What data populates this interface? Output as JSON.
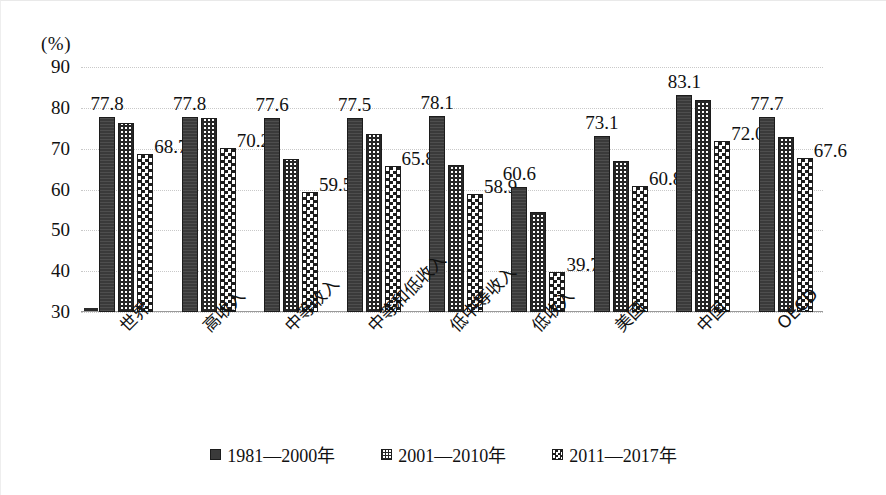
{
  "chart_data": {
    "type": "bar",
    "title": "",
    "xlabel": "",
    "ylabel": "",
    "unit_label": "(%)",
    "ylim": [
      30,
      90
    ],
    "yticks": [
      30,
      40,
      50,
      60,
      70,
      80,
      90
    ],
    "grid": true,
    "legend_position": "bottom",
    "categories": [
      "世界",
      "高收入",
      "中等收入",
      "中等和低收入",
      "低中等收入",
      "低收入",
      "美国",
      "中国",
      "OECD"
    ],
    "series": [
      {
        "name": "1981—2000年",
        "pattern": "solid-dark",
        "values": [
          77.8,
          77.8,
          77.6,
          77.5,
          78.1,
          60.6,
          73.1,
          83.1,
          77.7
        ],
        "labels": [
          "77.8",
          "77.8",
          "77.6",
          "77.5",
          "78.1",
          "60.6",
          "73.1",
          "83.1",
          "77.7"
        ]
      },
      {
        "name": "2001—2010年",
        "pattern": "fine-grid",
        "values": [
          76.3,
          77.5,
          67.5,
          73.5,
          66.0,
          54.5,
          67.0,
          82.0,
          72.8
        ],
        "labels": [
          "",
          "",
          "",
          "",
          "",
          "",
          "",
          "",
          ""
        ]
      },
      {
        "name": "2011—2017年",
        "pattern": "checkerboard",
        "values": [
          68.7,
          70.2,
          59.5,
          65.8,
          58.9,
          39.7,
          60.8,
          72.0,
          67.6
        ],
        "labels": [
          "68.7",
          "70.2",
          "59.5",
          "65.8",
          "58.9",
          "39.7",
          "60.8",
          "72.0",
          "67.6"
        ]
      }
    ]
  },
  "legend": {
    "items": [
      {
        "label": "1981—2000年"
      },
      {
        "label": "2001—2010年"
      },
      {
        "label": "2011—2017年"
      }
    ]
  }
}
